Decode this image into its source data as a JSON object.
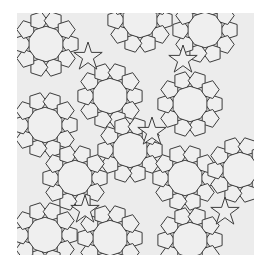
{
  "figure": {
    "type": "geometric-tiling",
    "colors": {
      "background": "#ffffff",
      "tile_fill": "#efefef",
      "line": "#3c3c3c"
    },
    "bounds": {
      "x": 17,
      "y": 13,
      "width": 237,
      "height": 242
    },
    "unit_edge": 11,
    "decagons": [
      {
        "cx": 46,
        "cy": 44
      },
      {
        "cx": 205,
        "cy": 30
      },
      {
        "cx": 140,
        "cy": 20
      },
      {
        "cx": 110,
        "cy": 96
      },
      {
        "cx": 190,
        "cy": 104
      },
      {
        "cx": 45,
        "cy": 125
      },
      {
        "cx": 130,
        "cy": 150
      },
      {
        "cx": 75,
        "cy": 178
      },
      {
        "cx": 185,
        "cy": 178
      },
      {
        "cx": 240,
        "cy": 170
      },
      {
        "cx": 45,
        "cy": 235
      },
      {
        "cx": 110,
        "cy": 238
      },
      {
        "cx": 190,
        "cy": 240
      }
    ],
    "stars": [
      {
        "cx": 88,
        "cy": 57
      },
      {
        "cx": 183,
        "cy": 60
      },
      {
        "cx": 152,
        "cy": 132
      },
      {
        "cx": 85,
        "cy": 210
      },
      {
        "cx": 225,
        "cy": 212
      }
    ]
  }
}
